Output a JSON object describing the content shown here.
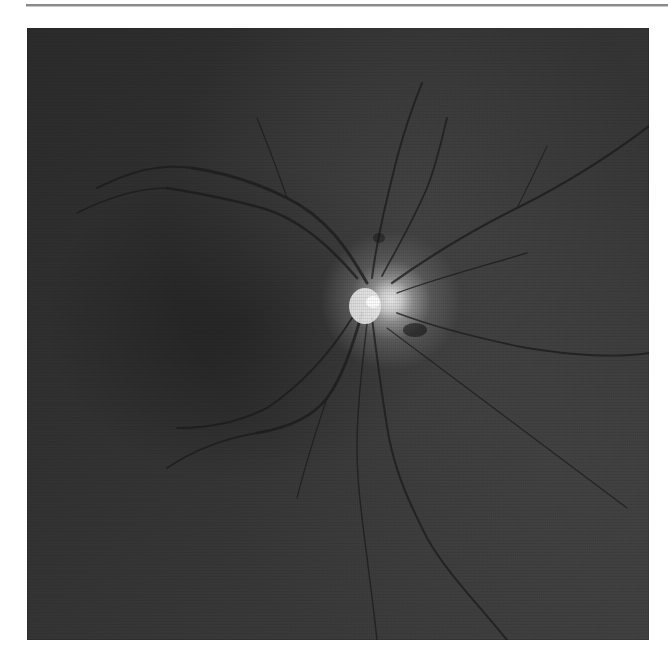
{
  "image": {
    "subject": "retinal fundus photograph (grayscale)",
    "alt": "Grayscale fundus image showing optic disc and retinal blood vessels",
    "optic_disc": {
      "x_pct": 58.5,
      "y_pct": 44.5
    },
    "colors": {
      "background": "#ffffff",
      "rule": "#8a8a8a",
      "fundus_dark": "#2c2c2c",
      "fundus_light": "#404040",
      "optic_disc": "#e8e8e8",
      "vessel": "#1a1a1a"
    }
  }
}
